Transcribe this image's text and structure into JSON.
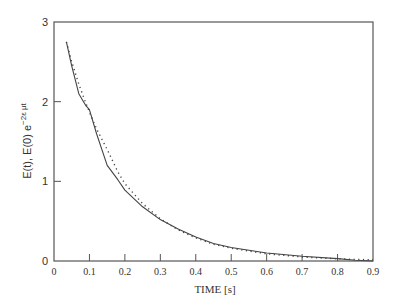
{
  "chart_data": {
    "type": "line",
    "title": "",
    "xlabel": "TIME [s]",
    "ylabel": "E(t),  E(0) e^{-2εμt}",
    "ylabel_parts": {
      "main": "E(t),  E(0) e",
      "sup": "−2ε μt"
    },
    "xlim": [
      0,
      0.9
    ],
    "ylim": [
      0,
      3
    ],
    "xticks": [
      "0",
      "0.1",
      "0.2",
      "0.3",
      "0.4",
      "0.5",
      "0.6",
      "0.7",
      "0.8",
      "0.9"
    ],
    "yticks": [
      "0",
      "1",
      "2",
      "3"
    ],
    "grid": false,
    "legend": null,
    "series": [
      {
        "name": "E(t)",
        "style": "solid",
        "x": [
          0.035,
          0.05,
          0.07,
          0.09,
          0.1,
          0.12,
          0.15,
          0.18,
          0.2,
          0.25,
          0.3,
          0.35,
          0.4,
          0.45,
          0.5,
          0.6,
          0.7,
          0.8,
          0.85,
          0.9
        ],
        "y": [
          2.75,
          2.45,
          2.1,
          1.95,
          1.9,
          1.6,
          1.2,
          1.02,
          0.89,
          0.68,
          0.52,
          0.4,
          0.3,
          0.22,
          0.17,
          0.1,
          0.06,
          0.03,
          0.01,
          0.0
        ]
      },
      {
        "name": "E(0) e^{-2εμt}",
        "style": "dotted",
        "x": [
          0.035,
          0.05,
          0.07,
          0.09,
          0.1,
          0.12,
          0.15,
          0.18,
          0.2,
          0.25,
          0.3,
          0.35,
          0.4,
          0.45,
          0.5,
          0.6,
          0.7,
          0.8,
          0.85,
          0.9
        ],
        "y": [
          2.75,
          2.5,
          2.22,
          1.98,
          1.87,
          1.66,
          1.4,
          1.12,
          0.97,
          0.72,
          0.53,
          0.39,
          0.29,
          0.21,
          0.16,
          0.09,
          0.05,
          0.027,
          0.02,
          0.015
        ]
      }
    ]
  }
}
